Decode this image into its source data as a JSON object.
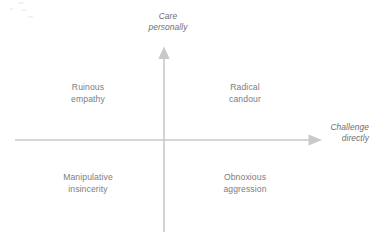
{
  "diagram": {
    "type": "2x2-quadrant-matrix",
    "background_color": "#ffffff",
    "axis_color": "#c9c9c9",
    "label_color": "#7d7d7d",
    "axis_label_color": "#6e6e6e",
    "axes": {
      "vertical": {
        "name": "care-personally-axis",
        "label_line1": "Care",
        "label_line2": "personally",
        "direction": "up"
      },
      "horizontal": {
        "name": "challenge-directly-axis",
        "label_line1": "Challenge",
        "label_line2": "directly",
        "direction": "right"
      }
    },
    "quadrants": [
      {
        "id": "ruinous-empathy",
        "position": "top-left",
        "line1": "Ruinous",
        "line2": "empathy"
      },
      {
        "id": "radical-candour",
        "position": "top-right",
        "line1": "Radical",
        "line2": "candour"
      },
      {
        "id": "manipulative-insincerity",
        "position": "bottom-left",
        "line1": "Manipulative",
        "line2": "insincerity"
      },
      {
        "id": "obnoxious-aggression",
        "position": "bottom-right",
        "line1": "Obnoxious",
        "line2": "aggression"
      }
    ]
  }
}
